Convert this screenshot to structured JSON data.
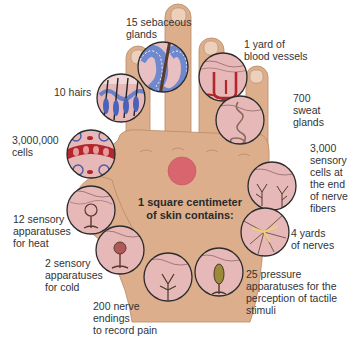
{
  "diagram": {
    "center_title": "1 square centimeter\nof skin contains:",
    "colors": {
      "skin": "#dcae8c",
      "skin_shadow": "#c8936e",
      "circle_fill": "#e6b8b8",
      "circle_border": "#2b2b2b",
      "highlight_spot": "#d9666e",
      "vessel_red": "#b3262c",
      "gland_blue": "#5b7fd0",
      "nerve_yellow": "#e8d27a"
    },
    "labels": {
      "sebaceous": "15 sebaceous\nglands",
      "blood_vessels": "1 yard of\nblood vessels",
      "hairs": "10 hairs",
      "sweat": "700\nsweat\nglands",
      "cells": "3,000,000\ncells",
      "sensory_cells": "3,000\nsensory\ncells at\nthe end\nof nerve\nfibers",
      "heat": "12 sensory\napparatuses\nfor heat",
      "nerves": "4 yards\nof nerves",
      "cold": "2 sensory\napparatuses\nfor cold",
      "pressure": "25 pressure\napparatuses for the\nperception of tactile\nstimuli",
      "pain": "200 nerve\nendings\nto record pain"
    },
    "callouts": [
      {
        "id": "hairs",
        "icon": "hair-follicles-icon"
      },
      {
        "id": "sebaceous",
        "icon": "sebaceous-gland-icon"
      },
      {
        "id": "blood_vessels",
        "icon": "blood-vessels-icon"
      },
      {
        "id": "sweat",
        "icon": "sweat-gland-icon"
      },
      {
        "id": "cells",
        "icon": "skin-cells-icon"
      },
      {
        "id": "sensory_cells",
        "icon": "nerve-endings-icon"
      },
      {
        "id": "heat",
        "icon": "heat-receptor-icon"
      },
      {
        "id": "nerves",
        "icon": "nerve-network-icon"
      },
      {
        "id": "cold",
        "icon": "cold-receptor-icon"
      },
      {
        "id": "pain",
        "icon": "pain-nerve-icon"
      },
      {
        "id": "pressure",
        "icon": "pressure-receptor-icon"
      }
    ]
  }
}
